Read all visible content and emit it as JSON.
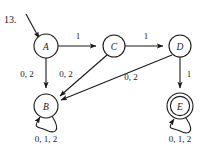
{
  "figure": {
    "number_label": "13.",
    "type": "finite-state-machine-diagram",
    "ink_color": "#1a1a1a",
    "background_color": "#ffffff"
  },
  "states": [
    {
      "id": "A",
      "label": "A",
      "kind": "start",
      "cx": 46,
      "cy": 46,
      "r": 12
    },
    {
      "id": "B",
      "label": "B",
      "kind": "normal",
      "cx": 46,
      "cy": 106,
      "r": 12
    },
    {
      "id": "C",
      "label": "C",
      "kind": "normal",
      "cx": 114,
      "cy": 46,
      "r": 11
    },
    {
      "id": "D",
      "label": "D",
      "kind": "normal",
      "cx": 180,
      "cy": 46,
      "r": 11
    },
    {
      "id": "E",
      "label": "E",
      "kind": "accepting",
      "cx": 180,
      "cy": 106,
      "r": 13
    }
  ],
  "start_arrow": {
    "from_state": "A",
    "x1": 26,
    "y1": 14,
    "x2": 39,
    "y2": 38
  },
  "transitions": [
    {
      "from": "A",
      "to": "C",
      "label": "1",
      "label_x": 78,
      "label_y": 36
    },
    {
      "from": "C",
      "to": "D",
      "label": "1",
      "label_x": 146,
      "label_y": 36
    },
    {
      "from": "A",
      "to": "B",
      "label": "0, 2",
      "label_x": 27,
      "label_y": 74
    },
    {
      "from": "C",
      "to": "B",
      "label": "0, 2",
      "label_x": 66,
      "label_y": 74
    },
    {
      "from": "D",
      "to": "B",
      "label": "0, 2",
      "label_x": 131,
      "label_y": 77
    },
    {
      "from": "D",
      "to": "E",
      "label": "1",
      "label_x": 187,
      "label_y": 76
    },
    {
      "from": "B",
      "to": "B",
      "label": "0, 1, 2",
      "label_x": 46,
      "label_y": 139,
      "self_loop": true
    },
    {
      "from": "E",
      "to": "E",
      "label": "0, 1, 2",
      "label_x": 180,
      "label_y": 139,
      "self_loop": true
    }
  ]
}
